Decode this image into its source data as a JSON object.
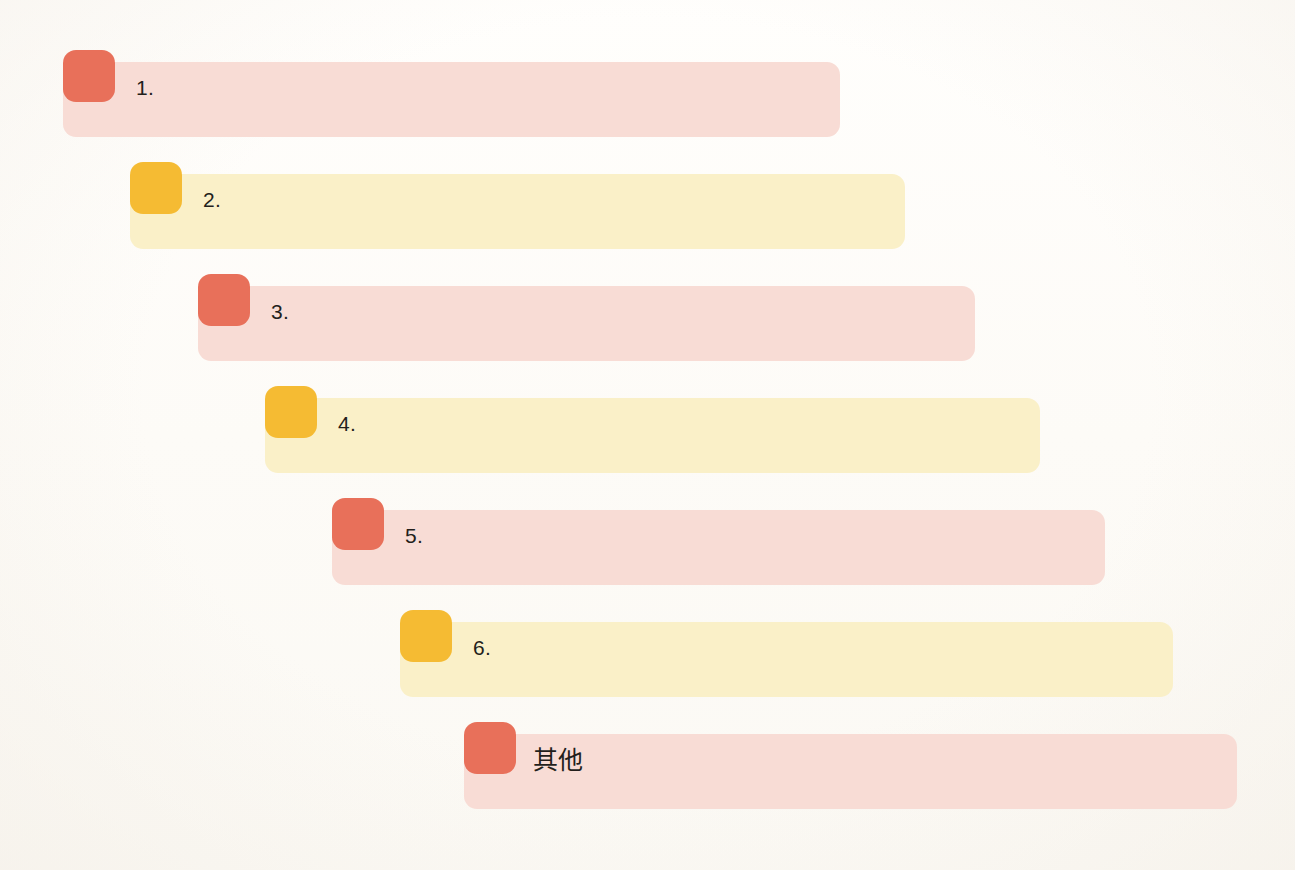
{
  "background_color": "#fdfcfa",
  "palette": {
    "coral_badge": "#e8705a",
    "coral_bar": "#f8dcd5",
    "amber_badge": "#f5bb33",
    "amber_bar": "#faf0c8",
    "label_text": "#231f1c"
  },
  "chart_data": {
    "type": "bar",
    "title": "",
    "subtitle": "",
    "xlabel": "",
    "ylabel": "",
    "grid": false,
    "legend": "none",
    "orientation": "horizontal",
    "style": "staircase-offset-list",
    "categories": [
      "1.",
      "2.",
      "3.",
      "4.",
      "5.",
      "6.",
      "其他"
    ],
    "values": [
      773,
      773,
      773,
      773,
      773,
      773,
      773
    ],
    "annotations": [
      "Seven stacked rounded bars arranged in a descending staircase, each with a solid rounded-square badge at its left edge.",
      "Badge and bar colors alternate coral/pink and amber/cream; the final row returns to coral.",
      "The last row is labelled 其他 (Other) instead of a number."
    ]
  },
  "rows": [
    {
      "index": 1,
      "label": "1.",
      "is_cjk": false,
      "badge_color": "#e8705a",
      "bar_color": "#f8dcd5",
      "top": 50,
      "left": 63,
      "bar_left": 63,
      "bar_width": 777,
      "label_left": 136
    },
    {
      "index": 2,
      "label": "2.",
      "is_cjk": false,
      "badge_color": "#f5bb33",
      "bar_color": "#faf0c8",
      "top": 162,
      "left": 130,
      "bar_left": 130,
      "bar_width": 775,
      "label_left": 203
    },
    {
      "index": 3,
      "label": "3.",
      "is_cjk": false,
      "badge_color": "#e8705a",
      "bar_color": "#f8dcd5",
      "top": 274,
      "left": 198,
      "bar_left": 198,
      "bar_width": 777,
      "label_left": 271
    },
    {
      "index": 4,
      "label": "4.",
      "is_cjk": false,
      "badge_color": "#f5bb33",
      "bar_color": "#faf0c8",
      "top": 386,
      "left": 265,
      "bar_left": 265,
      "bar_width": 775,
      "label_left": 338
    },
    {
      "index": 5,
      "label": "5.",
      "is_cjk": false,
      "badge_color": "#e8705a",
      "bar_color": "#f8dcd5",
      "top": 498,
      "left": 332,
      "bar_left": 332,
      "bar_width": 773,
      "label_left": 405
    },
    {
      "index": 6,
      "label": "6.",
      "is_cjk": false,
      "badge_color": "#f5bb33",
      "bar_color": "#faf0c8",
      "top": 610,
      "left": 400,
      "bar_left": 400,
      "bar_width": 773,
      "label_left": 473
    },
    {
      "index": 7,
      "label": "其他",
      "is_cjk": true,
      "badge_color": "#e8705a",
      "bar_color": "#f8dcd5",
      "top": 722,
      "left": 464,
      "bar_left": 464,
      "bar_width": 773,
      "label_left": 533
    }
  ]
}
